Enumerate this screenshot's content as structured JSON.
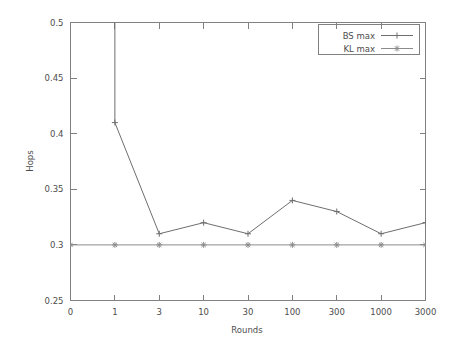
{
  "chart_data": {
    "type": "line",
    "title": "",
    "xlabel": "Rounds",
    "ylabel": "Hops",
    "categories": [
      "0",
      "1",
      "3",
      "10",
      "30",
      "100",
      "300",
      "1000",
      "3000"
    ],
    "x_tick_labels": [
      "0",
      "1",
      "3",
      "10",
      "30",
      "100",
      "300",
      "1000",
      "3000"
    ],
    "y_tick_labels": [
      "0.25",
      "0.3",
      "0.35",
      "0.4",
      "0.45",
      "0.5"
    ],
    "y_tick_values": [
      0.25,
      0.3,
      0.35,
      0.4,
      0.45,
      0.5
    ],
    "ylim": [
      0.25,
      0.5
    ],
    "grid": false,
    "legend_position": "top-right",
    "series": [
      {
        "name": "BS max",
        "marker": "plus",
        "color": "#6e6e6e",
        "values": [
          null,
          0.41,
          0.31,
          0.32,
          0.31,
          0.34,
          0.33,
          0.31,
          0.32
        ],
        "note": "value at Rounds=0 is above the plotted range (line clipped at top of axis)"
      },
      {
        "name": "KL max",
        "marker": "star",
        "color": "#8c8c8c",
        "values": [
          0.3,
          0.3,
          0.3,
          0.3,
          0.3,
          0.3,
          0.3,
          0.3,
          0.3
        ]
      }
    ]
  },
  "legend": {
    "entries": [
      {
        "label": "BS max"
      },
      {
        "label": "KL max"
      }
    ]
  },
  "axes": {
    "y_title": "Hops",
    "x_title": "Rounds"
  }
}
